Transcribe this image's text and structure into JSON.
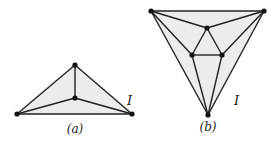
{
  "figures": [
    {
      "caption": "(a)",
      "face_label": "I",
      "vertices": [
        [
          75,
          65
        ],
        [
          75,
          98
        ],
        [
          17,
          114
        ],
        [
          132,
          114
        ]
      ],
      "edges": [
        [
          0,
          1
        ],
        [
          0,
          2
        ],
        [
          0,
          3
        ],
        [
          1,
          2
        ],
        [
          1,
          3
        ],
        [
          2,
          3
        ]
      ]
    },
    {
      "caption": "(b)",
      "face_label": "I",
      "vertices": [
        [
          151,
          11
        ],
        [
          264,
          11
        ],
        [
          208,
          115
        ],
        [
          207,
          28
        ],
        [
          192,
          55
        ],
        [
          222,
          55
        ]
      ],
      "edges": [
        [
          0,
          1
        ],
        [
          0,
          2
        ],
        [
          1,
          2
        ],
        [
          0,
          3
        ],
        [
          1,
          3
        ],
        [
          3,
          4
        ],
        [
          3,
          5
        ],
        [
          4,
          5
        ],
        [
          0,
          4
        ],
        [
          4,
          2
        ],
        [
          1,
          5
        ],
        [
          5,
          2
        ]
      ]
    }
  ],
  "colors": {
    "fill": "#ececec",
    "edge": "#222222",
    "vertex": "#111111"
  }
}
